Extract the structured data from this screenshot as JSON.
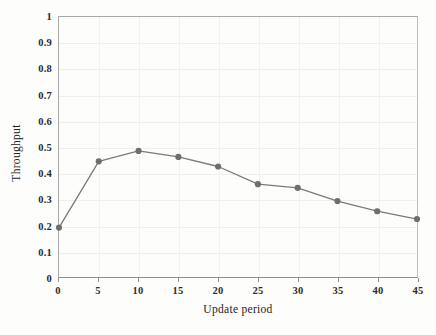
{
  "chart_data": {
    "type": "line",
    "title": "",
    "xlabel": "Update period",
    "ylabel": "Throughput",
    "x": [
      0,
      5,
      10,
      15,
      20,
      25,
      30,
      35,
      40,
      45
    ],
    "values": [
      0.19,
      0.445,
      0.485,
      0.462,
      0.425,
      0.357,
      0.343,
      0.292,
      0.253,
      0.223
    ],
    "series": [
      {
        "name": "Throughput",
        "values": [
          0.19,
          0.445,
          0.485,
          0.462,
          0.425,
          0.357,
          0.343,
          0.292,
          0.253,
          0.223
        ]
      }
    ],
    "xlim": [
      0,
      45
    ],
    "ylim": [
      0,
      1
    ],
    "xticks": [
      "0",
      "5",
      "10",
      "15",
      "20",
      "25",
      "30",
      "35",
      "40",
      "45"
    ],
    "xtick_values": [
      0,
      5,
      10,
      15,
      20,
      25,
      30,
      35,
      40,
      45
    ],
    "yticks": [
      "0",
      "0.1",
      "0.2",
      "0.3",
      "0.4",
      "0.5",
      "0.6",
      "0.7",
      "0.8",
      "0.9",
      "1"
    ],
    "ytick_values": [
      0,
      0.1,
      0.2,
      0.3,
      0.4,
      0.5,
      0.6,
      0.7,
      0.8,
      0.9,
      1
    ],
    "grid": true,
    "legend": false,
    "legend_position": "none",
    "marker": "circle",
    "line_color": "#7a7a7a",
    "marker_color": "#6e6e6e",
    "grid_color": "#efefef",
    "axis_color": "#8f8f8f",
    "background_color": "#fdfdfc"
  }
}
